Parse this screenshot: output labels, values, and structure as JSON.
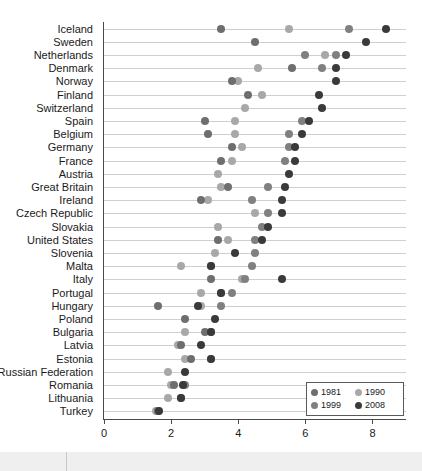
{
  "chart_data": {
    "type": "scatter",
    "title": "",
    "subtitle": "",
    "xlabel": "",
    "ylabel": "",
    "xlim": [
      0,
      9
    ],
    "xticks": [
      0,
      2,
      4,
      6,
      8
    ],
    "xtick_labels": [
      "0",
      "2",
      "4",
      "6",
      "8"
    ],
    "grid": "horizontal-row-lines",
    "legend_position": "bottom-right",
    "legend": [
      {
        "name": "1981",
        "color": "#6e6e6e"
      },
      {
        "name": "1990",
        "color": "#a8a8a8"
      },
      {
        "name": "1999",
        "color": "#808080"
      },
      {
        "name": "2008",
        "color": "#3a3a3a"
      }
    ],
    "series_colors": {
      "1981": "#6e6e6e",
      "1990": "#a8a8a8",
      "1999": "#808080",
      "2008": "#3a3a3a"
    },
    "categories": [
      "Iceland",
      "Sweden",
      "Netherlands",
      "Denmark",
      "Norway",
      "Finland",
      "Switzerland",
      "Spain",
      "Belgium",
      "Germany",
      "France",
      "Austria",
      "Great Britain",
      "Ireland",
      "Czech Republic",
      "Slovakia",
      "United States",
      "Slovenia",
      "Malta",
      "Italy",
      "Portugal",
      "Hungary",
      "Poland",
      "Bulgaria",
      "Latvia",
      "Estonia",
      "Russian Federation",
      "Romania",
      "Lithuania",
      "Turkey"
    ],
    "series": [
      {
        "name": "1981",
        "values": [
          3.5,
          4.5,
          null,
          5.6,
          3.8,
          4.3,
          null,
          3.0,
          3.1,
          3.8,
          3.5,
          null,
          3.7,
          2.9,
          null,
          null,
          3.4,
          null,
          3.2,
          3.2,
          3.5,
          1.6,
          2.4,
          3.0,
          2.3,
          2.6,
          null,
          2.1,
          2.3,
          1.6
        ]
      },
      {
        "name": "1990",
        "values": [
          5.5,
          null,
          null,
          4.6,
          4.0,
          4.7,
          4.2,
          3.9,
          3.9,
          4.1,
          3.8,
          3.4,
          3.5,
          3.1,
          4.5,
          3.4,
          3.7,
          3.3,
          2.3,
          4.1,
          2.9,
          2.9,
          null,
          2.4,
          2.2,
          2.4,
          1.9,
          2.0,
          1.9,
          1.55
        ]
      },
      {
        "name": "1999",
        "values": [
          7.3,
          null,
          6.0,
          6.5,
          null,
          null,
          null,
          5.9,
          5.5,
          5.5,
          5.4,
          null,
          4.9,
          4.4,
          4.9,
          4.7,
          4.5,
          4.5,
          4.4,
          4.2,
          3.8,
          3.5,
          null,
          3.2,
          null,
          3.2,
          null,
          2.4,
          null,
          null
        ]
      },
      {
        "name": "2008",
        "values": [
          8.4,
          7.8,
          7.2,
          6.9,
          6.9,
          6.4,
          6.5,
          6.1,
          5.9,
          5.7,
          5.7,
          5.5,
          5.4,
          5.3,
          5.3,
          4.9,
          4.7,
          3.9,
          3.2,
          5.3,
          3.5,
          2.8,
          3.3,
          3.2,
          2.9,
          3.2,
          2.4,
          2.35,
          2.3,
          1.65
        ]
      }
    ],
    "extra_points": [
      {
        "category": "Netherlands",
        "series": "1990",
        "value": 6.6
      },
      {
        "category": "Netherlands",
        "series": "1999",
        "value": 6.9
      }
    ]
  }
}
